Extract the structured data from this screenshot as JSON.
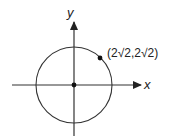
{
  "diagram": {
    "type": "coordinate-plane-circle",
    "axes": {
      "x_label": "x",
      "y_label": "y"
    },
    "circle": {
      "center": "origin",
      "radius_units": 4
    },
    "point": {
      "label": "(2√2,2√2)",
      "x_text": "2√2",
      "y_text": "2√2"
    },
    "colors": {
      "stroke": "#333333",
      "background": "#ffffff"
    }
  }
}
